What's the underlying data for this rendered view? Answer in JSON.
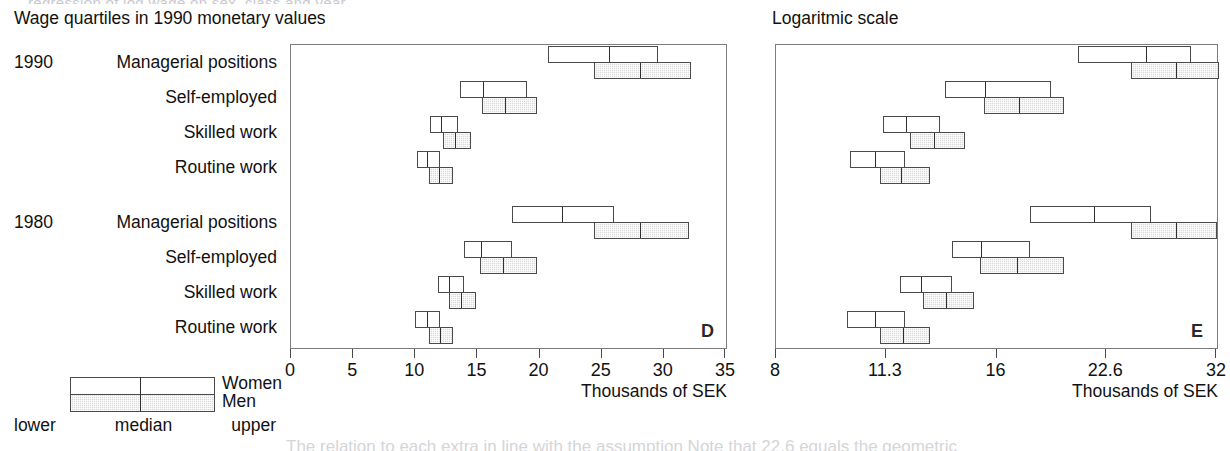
{
  "figure": {
    "top_cut_text": "regression of log wage on sex, class and year",
    "bottom_cut_text": "The relation to each extra in line with the assumption  Note that 22.6 equals the geometric"
  },
  "panels": {
    "left": {
      "title": "Wage quartiles in 1990 monetary values",
      "letter": "D",
      "axis_title": "Thousands of SEK",
      "scale": "linear"
    },
    "right": {
      "title": "Logaritmic scale",
      "letter": "E",
      "axis_title": "Thousands of SEK",
      "scale": "log"
    }
  },
  "legend": {
    "women_label": "Women",
    "men_label": "Men",
    "parts": [
      "lower",
      "median",
      "upper"
    ]
  },
  "rows": [
    {
      "year": "1990",
      "label": "Managerial positions"
    },
    {
      "year": "",
      "label": "Self-employed"
    },
    {
      "year": "",
      "label": "Skilled work"
    },
    {
      "year": "",
      "label": "Routine work"
    },
    {
      "year": "1980",
      "label": "Managerial positions"
    },
    {
      "year": "",
      "label": "Self-employed"
    },
    {
      "year": "",
      "label": "Skilled work"
    },
    {
      "year": "",
      "label": "Routine work"
    }
  ],
  "chart_data": [
    {
      "type": "bar",
      "chart_kind": "quartile-range-bars",
      "panel": "D",
      "title": "Wage quartiles in 1990 monetary values",
      "xlabel": "Thousands of SEK",
      "ylabel": "",
      "scale": "linear",
      "xlim": [
        0,
        35
      ],
      "xticks": [
        0,
        5,
        10,
        15,
        20,
        25,
        30,
        35
      ],
      "xticklabels": [
        "0",
        "5",
        "10",
        "15",
        "20",
        "25",
        "30",
        "35"
      ],
      "grid": false,
      "legend_position": "below-left",
      "categories": [
        "1990 Managerial positions",
        "1990 Self-employed",
        "1990 Skilled work",
        "1990 Routine work",
        "1980 Managerial positions",
        "1980 Self-employed",
        "1980 Skilled work",
        "1980 Routine work"
      ],
      "series": [
        {
          "name": "Women",
          "quartiles": [
            {
              "lower": 20.7,
              "median": 25.5,
              "upper": 29.5
            },
            {
              "lower": 13.6,
              "median": 15.4,
              "upper": 19.0
            },
            {
              "lower": 11.2,
              "median": 12.0,
              "upper": 13.4
            },
            {
              "lower": 10.1,
              "median": 10.9,
              "upper": 12.0
            },
            {
              "lower": 17.8,
              "median": 21.7,
              "upper": 26.0
            },
            {
              "lower": 13.9,
              "median": 15.2,
              "upper": 17.8
            },
            {
              "lower": 11.8,
              "median": 12.6,
              "upper": 13.9
            },
            {
              "lower": 10.0,
              "median": 10.9,
              "upper": 12.0
            }
          ]
        },
        {
          "name": "Men",
          "quartiles": [
            {
              "lower": 24.4,
              "median": 28.0,
              "upper": 32.2
            },
            {
              "lower": 15.4,
              "median": 17.1,
              "upper": 19.8
            },
            {
              "lower": 12.2,
              "median": 13.1,
              "upper": 14.5
            },
            {
              "lower": 11.1,
              "median": 11.8,
              "upper": 13.0
            },
            {
              "lower": 24.4,
              "median": 28.0,
              "upper": 32.0
            },
            {
              "lower": 15.2,
              "median": 17.0,
              "upper": 19.8
            },
            {
              "lower": 12.7,
              "median": 13.6,
              "upper": 14.9
            },
            {
              "lower": 11.1,
              "median": 11.9,
              "upper": 13.0
            }
          ]
        }
      ]
    },
    {
      "type": "bar",
      "chart_kind": "quartile-range-bars",
      "panel": "E",
      "title": "Logaritmic scale",
      "xlabel": "Thousands of SEK",
      "ylabel": "",
      "scale": "log",
      "xlim": [
        8,
        32
      ],
      "xticks": [
        8,
        11.3,
        16,
        22.6,
        32
      ],
      "xticklabels": [
        "8",
        "11.3",
        "16",
        "22.6",
        "32"
      ],
      "grid": false,
      "legend_position": "below-left",
      "categories": [
        "1990 Managerial positions",
        "1990 Self-employed",
        "1990 Skilled work",
        "1990 Routine work",
        "1980 Managerial positions",
        "1980 Self-employed",
        "1980 Skilled work",
        "1980 Routine work"
      ],
      "series": [
        {
          "name": "Women",
          "quartiles": [
            {
              "lower": 20.7,
              "median": 25.5,
              "upper": 29.5
            },
            {
              "lower": 13.6,
              "median": 15.4,
              "upper": 19.0
            },
            {
              "lower": 11.2,
              "median": 12.0,
              "upper": 13.4
            },
            {
              "lower": 10.1,
              "median": 10.9,
              "upper": 12.0
            },
            {
              "lower": 17.8,
              "median": 21.7,
              "upper": 26.0
            },
            {
              "lower": 13.9,
              "median": 15.2,
              "upper": 17.8
            },
            {
              "lower": 11.8,
              "median": 12.6,
              "upper": 13.9
            },
            {
              "lower": 10.0,
              "median": 10.9,
              "upper": 12.0
            }
          ]
        },
        {
          "name": "Men",
          "quartiles": [
            {
              "lower": 24.4,
              "median": 28.0,
              "upper": 32.2
            },
            {
              "lower": 15.4,
              "median": 17.1,
              "upper": 19.8
            },
            {
              "lower": 12.2,
              "median": 13.1,
              "upper": 14.5
            },
            {
              "lower": 11.1,
              "median": 11.8,
              "upper": 13.0
            },
            {
              "lower": 24.4,
              "median": 28.0,
              "upper": 32.0
            },
            {
              "lower": 15.2,
              "median": 17.0,
              "upper": 19.8
            },
            {
              "lower": 12.7,
              "median": 13.6,
              "upper": 14.9
            },
            {
              "lower": 11.1,
              "median": 11.9,
              "upper": 13.0
            }
          ]
        }
      ]
    }
  ]
}
